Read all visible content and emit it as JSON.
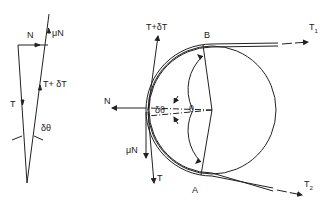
{
  "force_polygon": {
    "labels": {
      "N": "N",
      "muN": "μN",
      "T_plus_dT": "T+ δT",
      "T": "T",
      "d_theta": "δθ"
    }
  },
  "pulley_diagram": {
    "labels": {
      "T_plus_dT": "T+δT",
      "B": "B",
      "T1": "T",
      "T1_sub": "1",
      "N": "N",
      "d_theta": "δθ",
      "theta": "θ",
      "muN": "μN",
      "T": "T",
      "A": "A",
      "T2": "T",
      "T2_sub": "2"
    }
  },
  "colors": {
    "ink": "#222222",
    "background": "#ffffff"
  }
}
